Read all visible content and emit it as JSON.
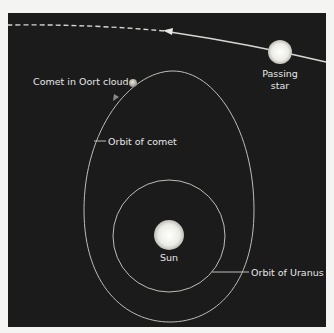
{
  "colors": {
    "page_background": "#f4f4f2",
    "panel_background": "#1b1b1b",
    "line": "#c8c8c4",
    "star_fill": "#f2f2ee",
    "comet_fill": "#cfcfc6",
    "text": "#e6e6e6"
  },
  "labels": {
    "comet": "Comet in Oort cloud",
    "orbit_comet": "Orbit of comet",
    "passing_star_line1": "Passing",
    "passing_star_line2": "star",
    "sun": "Sun",
    "orbit_uranus": "Orbit of Uranus"
  },
  "icons": {
    "star_path_arrow": "arrowhead-left",
    "comet_orbit_arrow": "arrowhead-down-left"
  }
}
